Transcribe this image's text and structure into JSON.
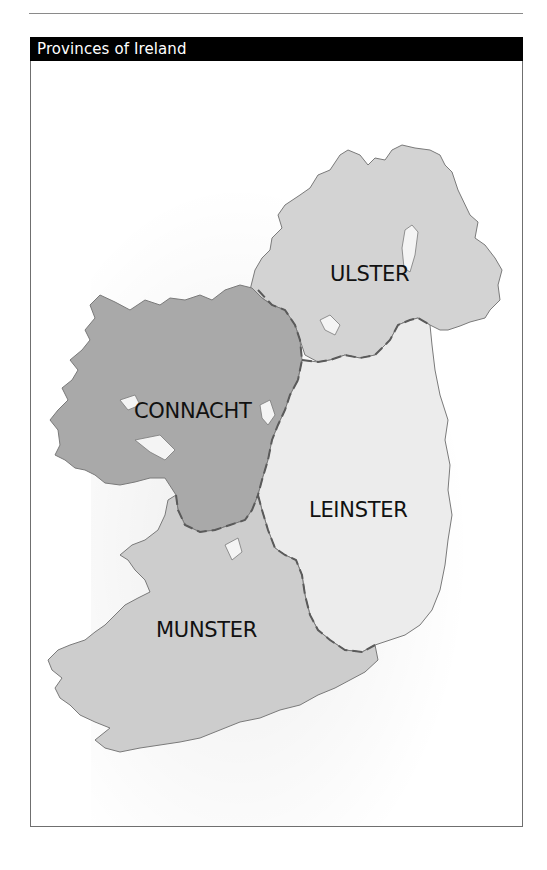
{
  "title": "Provinces of Ireland",
  "map": {
    "colors": {
      "ulster": "#d3d3d3",
      "connacht": "#a9a9a9",
      "leinster": "#ececec",
      "munster": "#cdcdcd",
      "coastline": "#7a7a7a",
      "boundary": "#5a5a5a"
    },
    "provinces": [
      {
        "id": "ulster",
        "label": "ULSTER",
        "x": 330,
        "y": 262
      },
      {
        "id": "connacht",
        "label": "CONNACHT",
        "x": 134,
        "y": 399
      },
      {
        "id": "leinster",
        "label": "LEINSTER",
        "x": 309,
        "y": 498
      },
      {
        "id": "munster",
        "label": "MUNSTER",
        "x": 156,
        "y": 618
      }
    ]
  }
}
